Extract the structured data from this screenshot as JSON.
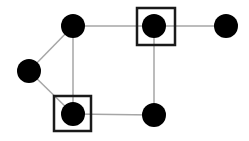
{
  "diagram": {
    "type": "graph",
    "width": 249,
    "height": 141,
    "colors": {
      "node": "#000000",
      "edge": "#a6a6a6",
      "box": "#1a1a1a",
      "background": "#ffffff"
    },
    "node_radius": 12,
    "nodes": [
      {
        "id": "n_top_left",
        "x": 73,
        "y": 26,
        "boxed": false
      },
      {
        "id": "n_left",
        "x": 29,
        "y": 71,
        "boxed": false
      },
      {
        "id": "n_bottom_left",
        "x": 73,
        "y": 114,
        "boxed": true
      },
      {
        "id": "n_top_mid",
        "x": 154,
        "y": 26,
        "boxed": true
      },
      {
        "id": "n_top_right",
        "x": 226,
        "y": 26,
        "boxed": false
      },
      {
        "id": "n_bottom_right",
        "x": 154,
        "y": 115,
        "boxed": false
      }
    ],
    "edges": [
      {
        "from": "n_top_left",
        "to": "n_left"
      },
      {
        "from": "n_top_left",
        "to": "n_bottom_left"
      },
      {
        "from": "n_top_left",
        "to": "n_top_mid"
      },
      {
        "from": "n_left",
        "to": "n_bottom_left"
      },
      {
        "from": "n_bottom_left",
        "to": "n_bottom_right"
      },
      {
        "from": "n_top_mid",
        "to": "n_top_right"
      },
      {
        "from": "n_top_mid",
        "to": "n_bottom_right"
      }
    ],
    "boxes": [
      {
        "around": "n_bottom_left",
        "x": 54,
        "y": 96,
        "w": 37,
        "h": 35
      },
      {
        "around": "n_top_mid",
        "x": 137,
        "y": 8,
        "w": 38,
        "h": 37
      }
    ]
  }
}
